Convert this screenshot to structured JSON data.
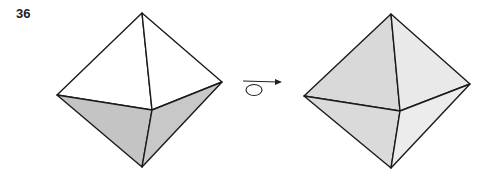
{
  "problem": {
    "number": "36"
  },
  "figures": {
    "left": {
      "label": "octahedron-original",
      "vertices": {
        "top": [
          142,
          13
        ],
        "left": [
          57,
          95
        ],
        "right": [
          222,
          82
        ],
        "center": [
          152,
          110
        ],
        "bottom": [
          142,
          167
        ]
      },
      "colors": {
        "upper": "#ffffff",
        "lower": "#c4c4c4"
      }
    },
    "right": {
      "label": "octahedron-rotated",
      "vertices": {
        "top": [
          391,
          14
        ],
        "left": [
          304,
          96
        ],
        "right": [
          470,
          84
        ],
        "center": [
          400,
          111
        ],
        "bottom": [
          391,
          168
        ]
      },
      "colors": {
        "upper_left": "#d9d9d9",
        "upper_right": "#e9e9e9",
        "lower_left": "#dadada",
        "lower_right": "#ececec"
      }
    },
    "rotation_symbol": {
      "arrow_color": "#222222"
    }
  }
}
